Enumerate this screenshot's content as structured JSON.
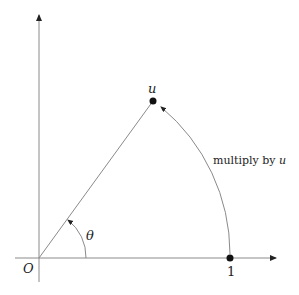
{
  "labels": {
    "origin": "O",
    "unit_point": "1",
    "u_point": "u",
    "angle": "θ",
    "arc_caption": "multiply by u",
    "arc_caption_prefix": "multiply by ",
    "arc_caption_var": "u"
  },
  "colors": {
    "line": "#8a8a8a",
    "point": "#111111",
    "text": "#222222"
  },
  "geometry": {
    "origin": [
      39,
      258
    ],
    "unit_point": [
      230,
      258
    ],
    "u_point": [
      153,
      101
    ]
  }
}
